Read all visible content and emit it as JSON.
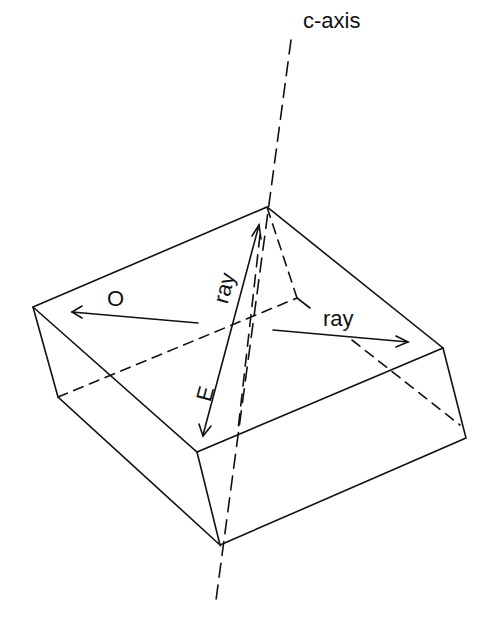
{
  "diagram": {
    "type": "crystal-birefringence",
    "labels": {
      "axis": "c-axis",
      "ordinary": "O",
      "extraordinary": "E",
      "ray_e": "ray",
      "ray_right": "ray"
    },
    "colors": {
      "line": "#111111",
      "background": "#ffffff"
    }
  }
}
